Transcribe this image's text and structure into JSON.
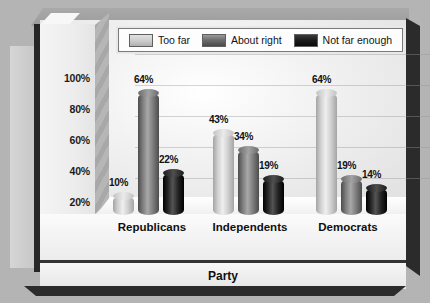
{
  "chart_data": {
    "type": "bar",
    "title": "",
    "subtitle": "",
    "xlabel": "Party",
    "ylabel": "",
    "categories": [
      "Republicans",
      "Independents",
      "Democrats"
    ],
    "series": [
      {
        "name": "Too far",
        "values": [
          10,
          43,
          64
        ],
        "color": "#c9c9c9"
      },
      {
        "name": "About right",
        "values": [
          64,
          34,
          19
        ],
        "color": "#767676"
      },
      {
        "name": "Not far enough",
        "values": [
          22,
          19,
          14
        ],
        "color": "#1e1e1e"
      }
    ],
    "value_labels": [
      [
        "10%",
        "64%",
        "22%"
      ],
      [
        "43%",
        "34%",
        "19%"
      ],
      [
        "64%",
        "19%",
        "14%"
      ]
    ],
    "ylim": [
      0,
      100
    ],
    "yticks": [
      0,
      20,
      40,
      60,
      80,
      100
    ],
    "ytick_labels": [
      "0%",
      "20%",
      "40%",
      "60%",
      "80%",
      "100%"
    ],
    "grid": true,
    "legend_position": "top",
    "style": "3d-cylinder",
    "units": "percent"
  },
  "legend": {
    "items": [
      {
        "label": "Too far",
        "swatch": "#c9c9c9"
      },
      {
        "label": "About right",
        "swatch": "#6e6e6e"
      },
      {
        "label": "Not far enough",
        "swatch": "#1a1a1a"
      }
    ]
  },
  "axes": {
    "y_tick_labels": [
      "100%",
      "80%",
      "60%",
      "40%",
      "20%",
      "0%"
    ],
    "x_title": "Party",
    "x_categories": [
      "Republicans",
      "Independents",
      "Democrats"
    ]
  },
  "colors": {
    "background": "#b4b4b4",
    "plot_background": "#f2f2f2",
    "frame_dark": "#2b2b2b",
    "series_light": "#c9c9c9",
    "series_medium": "#767676",
    "series_dark": "#1e1e1e"
  }
}
